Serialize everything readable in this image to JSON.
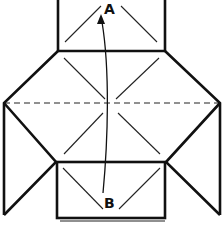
{
  "diagram": {
    "type": "origami-fold-step",
    "labels": {
      "point_a": "A",
      "point_b": "B"
    },
    "instruction_arrow": {
      "from": "B",
      "to": "A",
      "meaning": "fold point B up to point A"
    },
    "lines": {
      "dashed_fold_line": "horizontal valley fold line across center",
      "outline": "thick edges",
      "creases": "thin diagonal creases"
    },
    "colors": {
      "ink": "#111111",
      "background": "#ffffff"
    }
  }
}
